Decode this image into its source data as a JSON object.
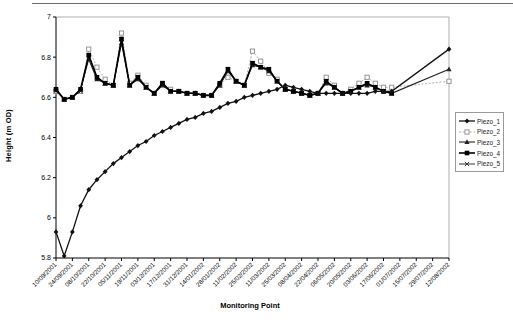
{
  "chart_data": {
    "type": "line",
    "title": "",
    "xlabel": "Monitoring Point",
    "ylabel": "Height (m OD)",
    "ylim": [
      5.8,
      7
    ],
    "yticks": [
      "5.8",
      "6",
      "6.2",
      "6.4",
      "6.6",
      "6.8",
      "7"
    ],
    "grid": false,
    "legend_position": "right",
    "x_labels_shown_every": 2,
    "x": [
      "10/09/2001",
      "17/09/2001",
      "24/09/2001",
      "01/10/2001",
      "08/10/2001",
      "15/10/2001",
      "22/10/2001",
      "29/10/2001",
      "05/11/2001",
      "12/11/2001",
      "19/11/2001",
      "26/11/2001",
      "03/12/2001",
      "10/12/2001",
      "17/12/2001",
      "24/12/2001",
      "31/12/2001",
      "07/01/2002",
      "14/01/2002",
      "21/01/2002",
      "28/01/2002",
      "04/02/2002",
      "11/02/2002",
      "18/02/2002",
      "25/02/2002",
      "04/03/2002",
      "11/03/2002",
      "18/03/2002",
      "25/03/2002",
      "01/04/2002",
      "08/04/2002",
      "15/04/2002",
      "22/04/2002",
      "29/04/2002",
      "06/05/2002",
      "13/05/2002",
      "20/05/2002",
      "27/05/2002",
      "03/06/2002",
      "10/06/2002",
      "17/06/2002",
      "24/06/2002",
      "01/07/2002",
      "08/07/2002",
      "15/07/2002",
      "22/07/2002",
      "29/07/2002",
      "05/08/2002",
      "12/08/2002"
    ],
    "x_tick_labels": [
      "10/09/2001",
      "24/09/2001",
      "08/10/2001",
      "22/10/2001",
      "05/11/2001",
      "19/11/2001",
      "03/12/2001",
      "17/12/2001",
      "31/12/2001",
      "14/01/2002",
      "28/01/2002",
      "11/02/2002",
      "25/02/2002",
      "11/03/2002",
      "25/03/2002",
      "08/04/2002",
      "22/04/2002",
      "06/05/2002",
      "20/05/2002",
      "03/06/2002",
      "17/06/2002",
      "01/07/2002",
      "15/07/2002",
      "29/07/2002",
      "12/08/2002"
    ],
    "series": [
      {
        "name": "Piezo_1",
        "marker": "diamond",
        "color": "#111111",
        "line_width": 1.3,
        "dash": "",
        "values": [
          5.93,
          5.81,
          5.93,
          6.06,
          6.14,
          6.19,
          6.23,
          6.27,
          6.3,
          6.33,
          6.36,
          6.38,
          6.41,
          6.43,
          6.45,
          6.47,
          6.49,
          6.5,
          6.52,
          6.53,
          6.55,
          6.57,
          6.58,
          6.6,
          6.61,
          6.62,
          6.63,
          6.64,
          6.66,
          6.65,
          6.64,
          6.63,
          6.62,
          6.62,
          6.62,
          6.62,
          6.62,
          6.62,
          6.62,
          6.63,
          6.63,
          6.63,
          null,
          null,
          null,
          null,
          null,
          null,
          6.84
        ]
      },
      {
        "name": "Piezo_2",
        "marker": "open-square",
        "color": "#a8a8a8",
        "line_width": 0.9,
        "dash": "2,1.6",
        "values": [
          6.63,
          6.59,
          6.6,
          6.63,
          6.84,
          6.75,
          6.69,
          6.66,
          6.92,
          6.67,
          6.71,
          6.66,
          6.62,
          6.67,
          6.64,
          6.63,
          6.62,
          6.62,
          6.61,
          6.61,
          6.66,
          6.7,
          6.68,
          6.66,
          6.83,
          6.78,
          6.72,
          6.69,
          6.64,
          6.63,
          6.62,
          6.61,
          6.62,
          6.7,
          6.66,
          6.62,
          6.64,
          6.67,
          6.7,
          6.67,
          6.65,
          6.65,
          null,
          null,
          null,
          null,
          null,
          null,
          6.68
        ]
      },
      {
        "name": "Piezo_3",
        "marker": "triangle",
        "color": "#222222",
        "line_width": 1.1,
        "dash": "",
        "values": [
          6.64,
          6.59,
          6.6,
          6.64,
          6.79,
          6.69,
          6.67,
          6.66,
          6.87,
          6.66,
          6.69,
          6.65,
          6.62,
          6.66,
          6.63,
          6.63,
          6.62,
          6.62,
          6.61,
          6.61,
          6.66,
          6.73,
          6.68,
          6.66,
          6.76,
          6.75,
          6.73,
          6.68,
          6.64,
          6.63,
          6.62,
          6.61,
          6.62,
          6.67,
          6.65,
          6.62,
          6.63,
          6.65,
          6.66,
          6.65,
          6.63,
          6.62,
          null,
          null,
          null,
          null,
          null,
          null,
          6.74
        ]
      },
      {
        "name": "Piezo_4",
        "marker": "square",
        "color": "#000000",
        "line_width": 1.6,
        "dash": "",
        "values": [
          6.64,
          6.59,
          6.6,
          6.64,
          6.81,
          6.7,
          6.67,
          6.66,
          6.89,
          6.66,
          6.7,
          6.65,
          6.62,
          6.67,
          6.63,
          6.63,
          6.62,
          6.62,
          6.61,
          6.61,
          6.67,
          6.74,
          6.68,
          6.66,
          6.77,
          6.75,
          6.74,
          6.68,
          6.64,
          6.63,
          6.62,
          6.61,
          6.62,
          6.68,
          6.65,
          6.62,
          6.63,
          6.65,
          6.67,
          6.65,
          6.63,
          6.62,
          null,
          null,
          null,
          null,
          null,
          null,
          null
        ]
      },
      {
        "name": "Piezo_5",
        "marker": "x",
        "color": "#333333",
        "line_width": 1.0,
        "dash": "",
        "values": [
          6.63,
          6.59,
          6.6,
          6.63,
          6.81,
          6.7,
          6.67,
          6.66,
          6.89,
          6.66,
          6.7,
          6.65,
          6.62,
          6.66,
          6.63,
          6.63,
          6.62,
          6.62,
          6.61,
          6.61,
          6.66,
          6.74,
          6.68,
          6.66,
          6.77,
          6.75,
          6.74,
          6.68,
          6.64,
          6.63,
          6.62,
          6.61,
          6.62,
          6.68,
          6.65,
          6.62,
          6.63,
          6.65,
          6.67,
          6.65,
          6.63,
          6.62,
          null,
          null,
          null,
          null,
          null,
          null,
          null
        ]
      }
    ]
  }
}
